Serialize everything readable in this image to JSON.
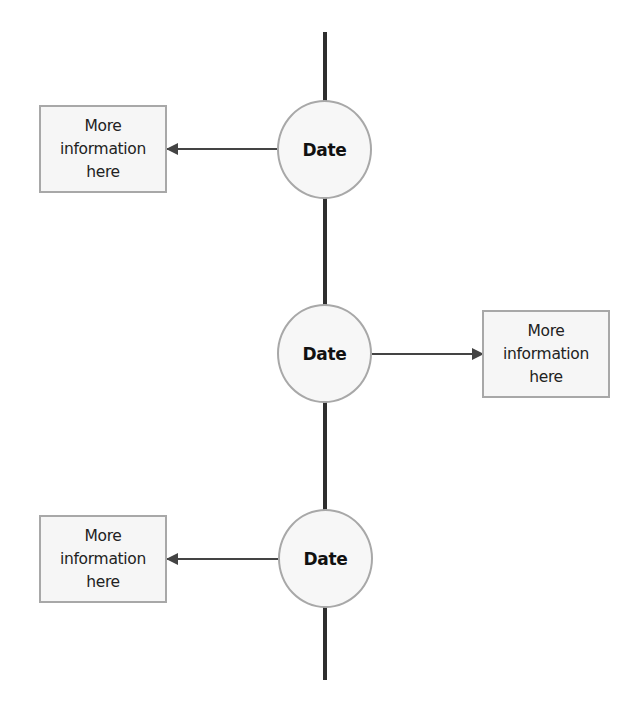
{
  "diagram": {
    "type": "vertical-timeline",
    "colors": {
      "line": "#2e2e2e",
      "node_border": "#a8a8a8",
      "node_fill": "#f7f7f7",
      "box_border": "#a8a8a8",
      "box_fill": "#f6f6f6",
      "arrow": "#444444"
    },
    "events": [
      {
        "date_label": "Date",
        "info": "More\ninformation\nhere",
        "side": "left"
      },
      {
        "date_label": "Date",
        "info": "More\ninformation\nhere",
        "side": "right"
      },
      {
        "date_label": "Date",
        "info": "More\ninformation\nhere",
        "side": "left"
      }
    ]
  }
}
